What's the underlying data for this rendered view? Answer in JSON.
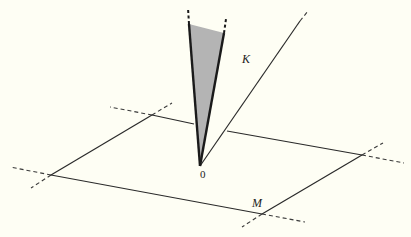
{
  "diagram": {
    "labels": {
      "cone": "K",
      "plane": "M",
      "origin": "0"
    },
    "colors": {
      "background": "#fefef4",
      "line": "#2a2a2a",
      "wedge_fill": "#b4b4b4"
    },
    "origin": [
      200,
      166
    ],
    "plane_corners": {
      "top_left": [
        152,
        115
      ],
      "right": [
        362,
        155
      ],
      "bottom": [
        262,
        214
      ],
      "bottom_left": [
        51,
        175
      ]
    },
    "wedge": {
      "left_top": [
        189,
        24
      ],
      "right_top": [
        224,
        33
      ]
    },
    "ray_end": [
      308,
      12
    ]
  }
}
